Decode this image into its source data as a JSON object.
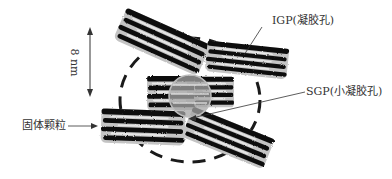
{
  "diagram": {
    "labels": {
      "igp": "IGP(凝胶孔)",
      "sgp": "SGP(小凝胶孔)",
      "solid_particle": "固体颗粒",
      "dimension": "8 nm"
    },
    "colors": {
      "sheet": "#111111",
      "interlayer": "#b8b8b8",
      "pore_circle": "#9a9a9a",
      "dashed_boundary": "#1a1a1a",
      "leader_line": "#333333",
      "text": "#333333"
    },
    "elements": {
      "particles": [
        {
          "name": "upper-left-particle",
          "cx": 162,
          "cy": 42,
          "angle": 24,
          "w": 92,
          "h": 34
        },
        {
          "name": "upper-right-particle",
          "cx": 247,
          "cy": 60,
          "angle": 6,
          "w": 82,
          "h": 30
        },
        {
          "name": "center-particle",
          "cx": 175,
          "cy": 92,
          "angle": 0,
          "w": 50,
          "h": 34
        },
        {
          "name": "center-right-particle",
          "cx": 215,
          "cy": 92,
          "angle": 0,
          "w": 40,
          "h": 30
        },
        {
          "name": "lower-left-particle",
          "cx": 143,
          "cy": 127,
          "angle": 2,
          "w": 84,
          "h": 34
        },
        {
          "name": "lower-right-particle",
          "cx": 228,
          "cy": 137,
          "angle": 22,
          "w": 88,
          "h": 32
        }
      ],
      "gel_pore": {
        "cx": 190,
        "cy": 96,
        "r": 21
      },
      "boundary": {
        "cx": 190,
        "cy": 100,
        "rx": 70,
        "ry": 62
      }
    }
  }
}
